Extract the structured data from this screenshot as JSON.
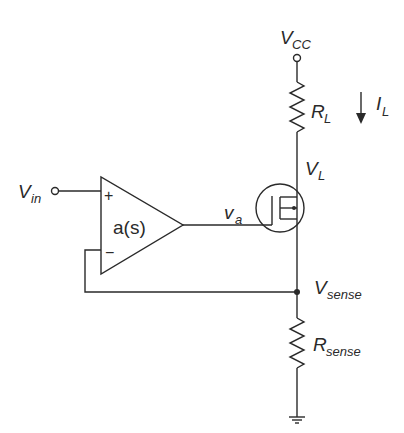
{
  "diagram": {
    "type": "circuit-schematic",
    "title": "",
    "labels": {
      "vcc": {
        "main": "V",
        "sub": "CC"
      },
      "rl": {
        "main": "R",
        "sub": "L"
      },
      "il": {
        "main": "I",
        "sub": "L"
      },
      "vl": {
        "main": "V",
        "sub": "L"
      },
      "vin": {
        "main": "V",
        "sub": "in"
      },
      "opamp_gain": "a(s)",
      "plus": "+",
      "minus": "−",
      "va": {
        "main": "v",
        "sub": "a"
      },
      "vsense": {
        "main": "V",
        "sub": "sense"
      },
      "rsense": {
        "main": "R",
        "sub": "sense"
      }
    },
    "components": [
      {
        "id": "vcc-terminal",
        "kind": "supply-terminal",
        "label": "VCC"
      },
      {
        "id": "rl",
        "kind": "resistor",
        "label": "RL"
      },
      {
        "id": "il-arrow",
        "kind": "current-arrow",
        "label": "IL",
        "direction": "down"
      },
      {
        "id": "mosfet",
        "kind": "nmos-transistor",
        "gate_node": "va",
        "drain_node": "VL",
        "source_node": "Vsense"
      },
      {
        "id": "opamp",
        "kind": "op-amp",
        "label": "a(s)",
        "noninverting_input": "Vin",
        "inverting_input": "Vsense",
        "output": "va"
      },
      {
        "id": "vin-terminal",
        "kind": "input-terminal",
        "label": "Vin"
      },
      {
        "id": "rsense",
        "kind": "resistor",
        "label": "Rsense"
      },
      {
        "id": "ground",
        "kind": "ground"
      }
    ],
    "colors": {
      "line": "#2a2a2a",
      "background": "#ffffff"
    }
  }
}
